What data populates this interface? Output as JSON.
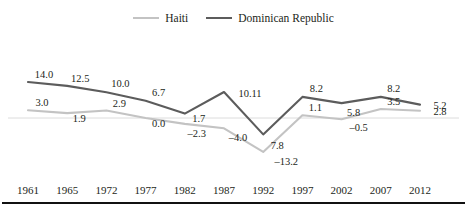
{
  "legend": {
    "position": "top-center",
    "entries": [
      {
        "name": "haiti",
        "label": "Haiti",
        "color": "#c3c3c3"
      },
      {
        "name": "dominican-republic",
        "label": "Dominican Republic",
        "color": "#5c5c5c"
      }
    ]
  },
  "axis": {
    "tick_labels": [
      "1961",
      "1965",
      "1972",
      "1977",
      "1982",
      "1987",
      "1992",
      "1997",
      "2002",
      "2007",
      "2012"
    ]
  },
  "labels": {
    "haiti": [
      "3.0",
      "1.9",
      "2.9",
      "0.0",
      "–2.3",
      "–4.0",
      "–13.2",
      "1.1",
      "–0.5",
      "3.5",
      "2.8"
    ],
    "dominican_republic": [
      "14.0",
      "12.5",
      "10.0",
      "6.7",
      "1.7",
      "10.11",
      "7.8",
      "8.2",
      "5.8",
      "8.2",
      "5.2"
    ]
  },
  "chart_data": {
    "type": "line",
    "title": "",
    "subtitle": "",
    "xlabel": "",
    "ylabel": "",
    "grid": false,
    "zero_line": true,
    "legend_position": "top-center",
    "categories": [
      "1961",
      "1965",
      "1972",
      "1977",
      "1982",
      "1987",
      "1992",
      "1997",
      "2002",
      "2007",
      "2012"
    ],
    "ylim": [
      -14.5,
      15.0
    ],
    "series": [
      {
        "name": "Haiti",
        "color": "#c3c3c3",
        "values": [
          3.0,
          1.9,
          2.9,
          0.0,
          -2.3,
          -4.0,
          -13.2,
          1.1,
          -0.5,
          3.5,
          2.8
        ],
        "data_labels": [
          "3.0",
          "1.9",
          "2.9",
          "0.0",
          "–2.3",
          "–4.0",
          "–13.2",
          "1.1",
          "–0.5",
          "3.5",
          "2.8"
        ]
      },
      {
        "name": "Dominican Republic",
        "color": "#5c5c5c",
        "values": [
          14.0,
          12.5,
          10.0,
          6.7,
          1.7,
          10.11,
          -6.4,
          8.2,
          5.8,
          8.2,
          5.2
        ],
        "data_labels": [
          "14.0",
          "12.5",
          "10.0",
          "6.7",
          "1.7",
          "10.11",
          "7.8",
          "8.2",
          "5.8",
          "8.2",
          "5.2"
        ]
      }
    ]
  }
}
